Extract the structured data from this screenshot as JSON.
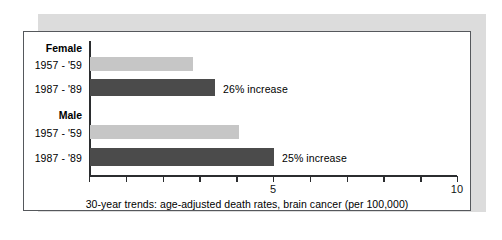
{
  "figure": {
    "caption": "30-year trends: age-adjusted death rates, brain cancer (per 100,000)",
    "frame_color": "#55585c",
    "shadow_color": "#dcdcdc",
    "background": "#ffffff"
  },
  "chart_data": {
    "type": "bar",
    "orientation": "horizontal",
    "title": "",
    "subtitle": "",
    "xlabel": "30-year trends: age-adjusted death rates, brain cancer (per 100,000)",
    "ylabel": "",
    "xlim": [
      0,
      10
    ],
    "xticks": [
      0,
      1,
      2,
      3,
      4,
      5,
      6,
      7,
      8,
      9,
      10
    ],
    "xtick_labels": [
      "",
      "",
      "",
      "",
      "",
      "5",
      "",
      "",
      "",
      "",
      "10"
    ],
    "grid": false,
    "legend": "none",
    "groups": [
      {
        "name": "Female",
        "bars": [
          {
            "category": "1957 - '59",
            "value": 2.8,
            "color": "#c6c6c6",
            "series": "1957 - '59",
            "annotation": ""
          },
          {
            "category": "1987 - '89",
            "value": 3.4,
            "color": "#4b4b4b",
            "series": "1987 - '89",
            "annotation": "26% increase"
          }
        ]
      },
      {
        "name": "Male",
        "bars": [
          {
            "category": "1957 - '59",
            "value": 4.05,
            "color": "#c6c6c6",
            "series": "1957 - '59",
            "annotation": ""
          },
          {
            "category": "1987 - '89",
            "value": 5.0,
            "color": "#4b4b4b",
            "series": "1987 - '89",
            "annotation": "25% increase"
          }
        ]
      }
    ],
    "series": [
      {
        "name": "1957 - '59",
        "values": [
          2.8,
          4.05
        ],
        "color": "#c6c6c6"
      },
      {
        "name": "1987 - '89",
        "values": [
          3.4,
          5.0
        ],
        "color": "#4b4b4b"
      }
    ],
    "categories": [
      "Female",
      "Male"
    ],
    "annotations": [
      "26% increase",
      "25% increase"
    ]
  },
  "labels": {
    "group_female": "Female",
    "group_male": "Male",
    "female_early": "1957 - '59",
    "female_late": "1987 - '89",
    "male_early": "1957 - '59",
    "male_late": "1987 - '89",
    "annotation_female": "26% increase",
    "annotation_male": "25% increase",
    "tick_5": "5",
    "tick_10": "10"
  }
}
